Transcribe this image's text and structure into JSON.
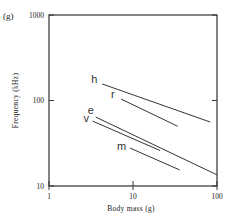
{
  "panel_label": "(g)",
  "chart_data": {
    "type": "line",
    "title": "",
    "xlabel": "Body mass (g)",
    "ylabel": "Frequency (kHz)",
    "xscale": "log",
    "yscale": "log",
    "xlim": [
      1,
      100
    ],
    "ylim": [
      10,
      1000
    ],
    "xticks": [
      "1",
      "10",
      "100"
    ],
    "yticks": [
      "10",
      "100",
      "1000"
    ],
    "grid": false,
    "legend": "inline labels at left end of each line",
    "series": [
      {
        "name": "h",
        "x": [
          4.3,
          83
        ],
        "y": [
          156,
          56
        ]
      },
      {
        "name": "r",
        "x": [
          7.2,
          34
        ],
        "y": [
          104,
          50
        ]
      },
      {
        "name": "e",
        "x": [
          3.6,
          100
        ],
        "y": [
          64,
          13.5
        ]
      },
      {
        "name": "v",
        "x": [
          3.3,
          21
        ],
        "y": [
          57.5,
          26
        ]
      },
      {
        "name": "m",
        "x": [
          9.2,
          36
        ],
        "y": [
          27.8,
          15.4
        ]
      }
    ]
  }
}
